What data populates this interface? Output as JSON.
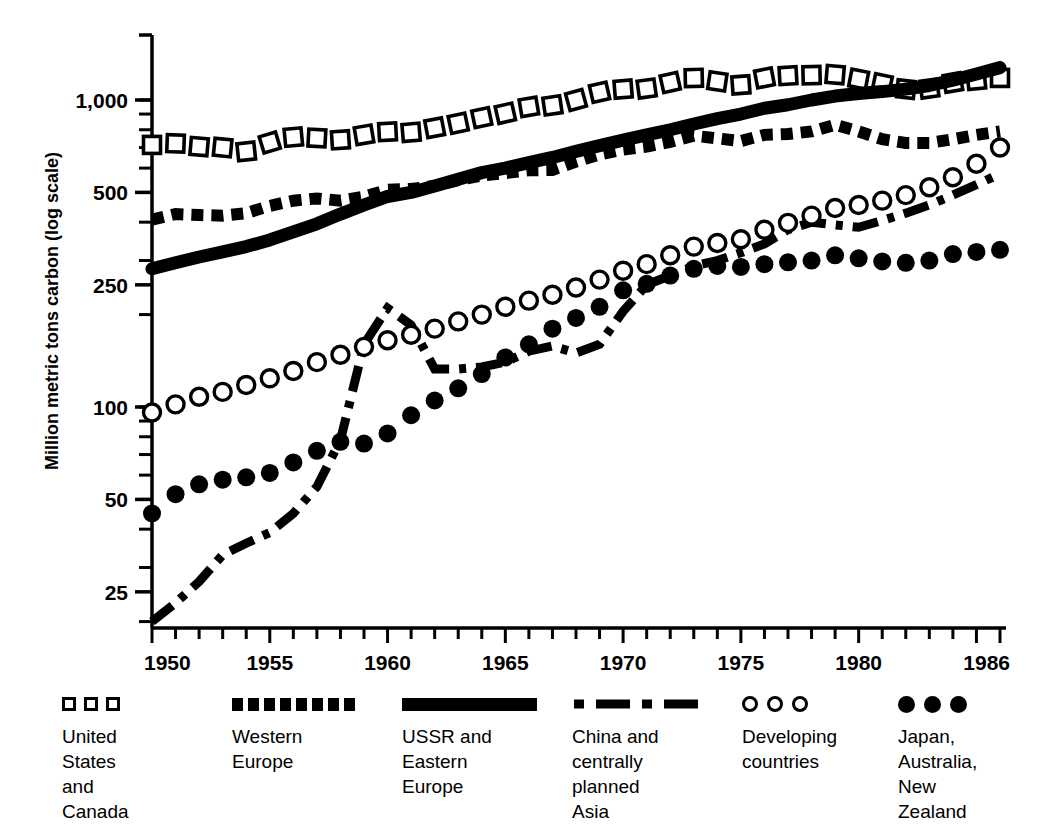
{
  "chart_data": {
    "type": "line",
    "title": "",
    "xlabel": "",
    "ylabel": "Million metric tons carbon (log scale)",
    "scale": "log",
    "grid": false,
    "legend_position": "bottom",
    "x_tick_labels": [
      "1950",
      "1955",
      "1960",
      "1965",
      "1970",
      "1975",
      "1980",
      "1986"
    ],
    "x_tick_values": [
      1950,
      1955,
      1960,
      1965,
      1970,
      1975,
      1980,
      1986
    ],
    "xlim": [
      1950,
      1986
    ],
    "y_tick_labels": [
      "1,000",
      "500",
      "250",
      "100",
      "50",
      "25"
    ],
    "y_tick_values": [
      1000,
      500,
      250,
      100,
      50,
      25
    ],
    "ylim": [
      19,
      1400
    ],
    "x": [
      1950,
      1951,
      1952,
      1953,
      1954,
      1955,
      1956,
      1957,
      1958,
      1959,
      1960,
      1961,
      1962,
      1963,
      1964,
      1965,
      1966,
      1967,
      1968,
      1969,
      1970,
      1971,
      1972,
      1973,
      1974,
      1975,
      1976,
      1977,
      1978,
      1979,
      1980,
      1981,
      1982,
      1983,
      1984,
      1985,
      1986
    ],
    "series": [
      {
        "name": "United States and Canada",
        "marker": "open-square",
        "style": "open square markers",
        "values": [
          714,
          722,
          705,
          700,
          680,
          727,
          757,
          752,
          742,
          770,
          788,
          785,
          812,
          840,
          876,
          905,
          950,
          960,
          1000,
          1060,
          1085,
          1090,
          1140,
          1180,
          1150,
          1120,
          1180,
          1200,
          1205,
          1210,
          1170,
          1130,
          1085,
          1090,
          1140,
          1160,
          1180
        ]
      },
      {
        "name": "Western Europe",
        "marker": "thick-dashed",
        "style": "thick dashed line",
        "values": [
          408,
          425,
          422,
          420,
          428,
          452,
          470,
          478,
          470,
          484,
          510,
          513,
          525,
          548,
          568,
          578,
          590,
          592,
          630,
          665,
          690,
          705,
          730,
          765,
          750,
          735,
          770,
          775,
          790,
          830,
          790,
          745,
          725,
          725,
          745,
          770,
          790
        ]
      },
      {
        "name": "USSR and Eastern Europe",
        "marker": "solid-thick",
        "style": "heavy solid line",
        "values": [
          282,
          295,
          308,
          320,
          333,
          350,
          372,
          395,
          425,
          455,
          485,
          500,
          525,
          552,
          580,
          600,
          625,
          650,
          680,
          710,
          740,
          770,
          800,
          835,
          870,
          900,
          940,
          965,
          1000,
          1030,
          1050,
          1065,
          1085,
          1115,
          1160,
          1215,
          1275
        ]
      },
      {
        "name": "China and centrally planned Asia",
        "marker": "dash-dot",
        "style": "dash-dot line",
        "values": [
          20,
          23,
          27,
          33,
          36,
          39,
          45,
          55,
          78,
          160,
          210,
          185,
          133,
          133,
          135,
          140,
          152,
          158,
          150,
          160,
          205,
          250,
          268,
          288,
          300,
          318,
          340,
          378,
          400,
          392,
          385,
          405,
          428,
          455,
          490,
          530,
          575
        ]
      },
      {
        "name": "Developing countries",
        "marker": "open-circle",
        "style": "open circle markers",
        "values": [
          96,
          102,
          108,
          112,
          118,
          124,
          131,
          140,
          148,
          157,
          165,
          172,
          180,
          190,
          200,
          212,
          222,
          232,
          245,
          260,
          278,
          292,
          312,
          333,
          342,
          352,
          378,
          398,
          420,
          445,
          455,
          470,
          490,
          520,
          560,
          620,
          700
        ]
      },
      {
        "name": "Japan, Australia, New Zealand",
        "marker": "filled-circle",
        "style": "filled circle markers",
        "values": [
          45,
          52,
          56,
          58,
          59,
          61,
          66,
          72,
          77,
          76,
          82,
          94,
          105,
          115,
          128,
          145,
          160,
          180,
          195,
          212,
          240,
          252,
          268,
          282,
          288,
          286,
          292,
          296,
          300,
          312,
          305,
          298,
          295,
          300,
          315,
          320,
          325
        ]
      }
    ]
  },
  "axis": {
    "y_title": "Million metric tons carbon (log scale)"
  },
  "legend": {
    "entries": [
      {
        "swatch": "open-square-swatch",
        "label": "United\nStates\nand\nCanada"
      },
      {
        "swatch": "dotted-square-swatch",
        "label": "Western\nEurope"
      },
      {
        "swatch": "solid-bar-swatch",
        "label": "USSR and\nEastern\nEurope"
      },
      {
        "swatch": "dash-dot-swatch",
        "label": "China and\ncentrally\nplanned\nAsia"
      },
      {
        "swatch": "open-circle-swatch",
        "label": "Developing\ncountries"
      },
      {
        "swatch": "filled-circle-swatch",
        "label": "Japan,\nAustralia,\nNew\nZealand"
      }
    ]
  },
  "colors": {
    "ink": "#000000",
    "paper": "#ffffff"
  }
}
